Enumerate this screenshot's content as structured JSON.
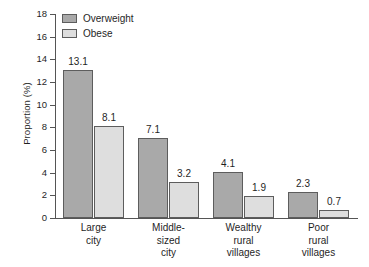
{
  "chart_data": {
    "type": "bar",
    "title": "",
    "xlabel": "",
    "ylabel": "Proportion (%)",
    "ylim": [
      0,
      18
    ],
    "ytick_values": [
      18,
      16,
      14,
      12,
      10,
      8,
      6,
      4,
      2,
      0
    ],
    "ytick_labels": [
      "18",
      "16",
      "14",
      "12",
      "10",
      "8",
      "6",
      "4",
      "2",
      "0"
    ],
    "grid": false,
    "legend_position": "top-left",
    "categories": [
      {
        "id": "large-city",
        "lines": [
          "Large",
          "city"
        ]
      },
      {
        "id": "middle-sized-city",
        "lines": [
          "Middle-",
          "sized",
          "city"
        ]
      },
      {
        "id": "wealthy-rural-villages",
        "lines": [
          "Wealthy",
          "rural",
          "villages"
        ]
      },
      {
        "id": "poor-rural-villages",
        "lines": [
          "Poor",
          "rural",
          "villages"
        ]
      }
    ],
    "series": [
      {
        "name": "Overweight",
        "color": "#a9a9a9",
        "values": [
          13.1,
          7.1,
          4.1,
          2.3
        ],
        "labels": [
          "13.1",
          "7.1",
          "4.1",
          "2.3"
        ]
      },
      {
        "name": "Obese",
        "color": "#dedede",
        "values": [
          8.1,
          3.2,
          1.9,
          0.7
        ],
        "labels": [
          "8.1",
          "3.2",
          "1.9",
          "0.7"
        ]
      }
    ]
  },
  "legend": {
    "items": [
      {
        "label": "Overweight",
        "color": "#a9a9a9"
      },
      {
        "label": "Obese",
        "color": "#dedede"
      }
    ]
  },
  "colors": {
    "overweight": "#a9a9a9",
    "obese": "#dedede",
    "axis": "#555555",
    "outline": "#5d5d5d",
    "text": "#1f1f1f",
    "background": "#ffffff"
  }
}
